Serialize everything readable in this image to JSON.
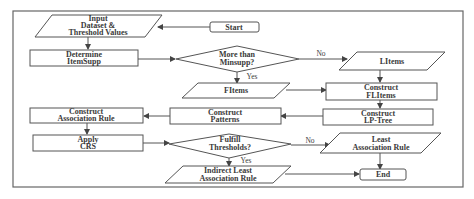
{
  "diagram": {
    "type": "flowchart",
    "nodes": {
      "start": {
        "label": "Start",
        "shape": "rounded-rect"
      },
      "input": {
        "line1": "Input",
        "line2": "Dataset &",
        "line3": "Threshold Values",
        "shape": "parallelogram"
      },
      "determine": {
        "line1": "Determine",
        "line2": "ItemSupp",
        "shape": "rect"
      },
      "decision1": {
        "line1": "More than",
        "line2": "Minsupp?",
        "shape": "diamond"
      },
      "litems": {
        "label": "LItems",
        "shape": "parallelogram"
      },
      "fitems": {
        "label": "FItems",
        "shape": "parallelogram"
      },
      "construct_flitems": {
        "line1": "Construct",
        "line2": "FLItems",
        "shape": "rect"
      },
      "construct_lptree": {
        "line1": "Construct",
        "line2": "LP-Tree",
        "shape": "rect"
      },
      "construct_patterns": {
        "line1": "Construct",
        "line2": "Patterns",
        "shape": "rect"
      },
      "construct_rule": {
        "line1": "Construct",
        "line2": "Association Rule",
        "shape": "rect"
      },
      "apply_crs": {
        "line1": "Apply",
        "line2": "CRS",
        "shape": "rect"
      },
      "decision2": {
        "line1": "Fulfill",
        "line2": "Thresholds?",
        "shape": "diamond"
      },
      "least_rule": {
        "line1": "Least",
        "line2": "Association Rule",
        "shape": "parallelogram"
      },
      "indirect_rule": {
        "line1": "Indirect Least",
        "line2": "Association Rule",
        "shape": "parallelogram"
      },
      "end": {
        "label": "End",
        "shape": "rounded-rect"
      }
    },
    "edge_labels": {
      "d1_no": "No",
      "d1_yes": "Yes",
      "d2_no": "No",
      "d2_yes": "Yes"
    },
    "edges": [
      [
        "start",
        "input"
      ],
      [
        "input",
        "determine"
      ],
      [
        "determine",
        "decision1"
      ],
      [
        "decision1",
        "litems",
        "No"
      ],
      [
        "decision1",
        "fitems",
        "Yes"
      ],
      [
        "litems",
        "construct_flitems"
      ],
      [
        "fitems",
        "construct_flitems"
      ],
      [
        "construct_flitems",
        "construct_lptree"
      ],
      [
        "construct_lptree",
        "construct_patterns"
      ],
      [
        "construct_patterns",
        "construct_rule"
      ],
      [
        "construct_rule",
        "apply_crs"
      ],
      [
        "apply_crs",
        "decision2"
      ],
      [
        "decision2",
        "least_rule",
        "No"
      ],
      [
        "decision2",
        "indirect_rule",
        "Yes"
      ],
      [
        "least_rule",
        "end"
      ],
      [
        "indirect_rule",
        "end"
      ]
    ]
  }
}
